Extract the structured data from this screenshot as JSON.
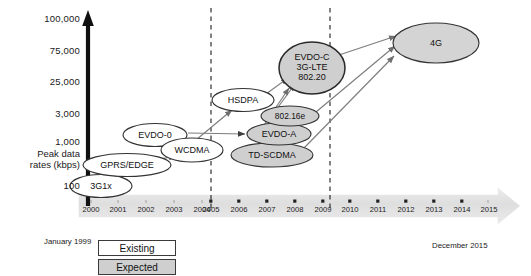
{
  "figure": {
    "axis": {
      "y_label": "Peak data\nrates (kbps)",
      "y_ticks": [
        "100,000",
        "75,000",
        "25,000",
        "3,000",
        "1,000",
        "100"
      ],
      "x_ticks": [
        "2000",
        "2001",
        "2002",
        "2003",
        "2004",
        "2005",
        "2006",
        "2007",
        "2008",
        "2009",
        "2010",
        "2011",
        "2012",
        "2013",
        "2014",
        "2015"
      ]
    },
    "notes": {
      "start": "January  1999",
      "end": "December 2015"
    },
    "legend": [
      {
        "label": "Existing",
        "fill": "#ffffff"
      },
      {
        "label": "Expected",
        "fill": "#cfcfcf"
      }
    ],
    "colors": {
      "axis": "#111111",
      "node_existing_fill": "#ffffff",
      "node_expected_fill": "#cfcfcf",
      "node_stroke": "#333333",
      "arrow": "#777777",
      "timeline_band": "#e3e3e3",
      "dashed_divider": "#222222"
    },
    "nodes": [
      {
        "id": "3g1x",
        "label": "3G1x",
        "cx": 101,
        "cy": 186,
        "rx": 31,
        "ry": 11.5,
        "state": "existing",
        "lines": 1
      },
      {
        "id": "gprs",
        "label": "GPRS/EDGE",
        "cx": 127,
        "cy": 165,
        "rx": 44,
        "ry": 11.5,
        "state": "existing",
        "lines": 1
      },
      {
        "id": "evdo0",
        "label": "EVDO-0",
        "cx": 155,
        "cy": 135,
        "rx": 32,
        "ry": 11.5,
        "state": "existing",
        "lines": 1
      },
      {
        "id": "wcdma",
        "label": "WCDMA",
        "cx": 192,
        "cy": 150,
        "rx": 31,
        "ry": 12,
        "state": "existing",
        "lines": 1
      },
      {
        "id": "hsdpa",
        "label": "HSDPA",
        "cx": 243,
        "cy": 100,
        "rx": 31,
        "ry": 11.5,
        "state": "existing",
        "lines": 1
      },
      {
        "id": "tdscdma",
        "label": "TD-SCDMA",
        "cx": 272,
        "cy": 155,
        "rx": 41,
        "ry": 12,
        "state": "expected",
        "lines": 1
      },
      {
        "id": "evdoa",
        "label": "EVDO-A",
        "cx": 279,
        "cy": 134,
        "rx": 32,
        "ry": 11,
        "state": "expected",
        "lines": 1
      },
      {
        "id": "80216e",
        "label": "802.16e",
        "cx": 290,
        "cy": 116,
        "rx": 29,
        "ry": 10,
        "state": "expected",
        "lines": 1
      },
      {
        "id": "evdoc",
        "label": "EVDO-C\n3G-LTE\n802.20",
        "cx": 312,
        "cy": 68,
        "rx": 33,
        "ry": 26,
        "state": "expected",
        "lines": 3
      },
      {
        "id": "4g",
        "label": "4G",
        "cx": 436,
        "cy": 43,
        "rx": 43,
        "ry": 20,
        "state": "expected",
        "lines": 1
      }
    ],
    "edges": [
      {
        "from": "3g1x",
        "to": "gprs"
      },
      {
        "from": "gprs",
        "to": "wcdma"
      },
      {
        "from": "wcdma",
        "to": "hsdpa"
      },
      {
        "from": "evdo0",
        "to": "evdoa"
      },
      {
        "from": "hsdpa",
        "to": "evdoc"
      },
      {
        "from": "80216e",
        "to": "evdoc"
      },
      {
        "from": "evdoa",
        "to": "evdoc"
      },
      {
        "from": "evdoc",
        "to": "4g"
      },
      {
        "from": "80216e",
        "to": "4g"
      },
      {
        "from": "tdscdma",
        "to": "4g"
      }
    ],
    "dividers": [
      {
        "id": "divider-2005",
        "x": 211
      },
      {
        "id": "divider-2010",
        "x": 330
      }
    ]
  }
}
